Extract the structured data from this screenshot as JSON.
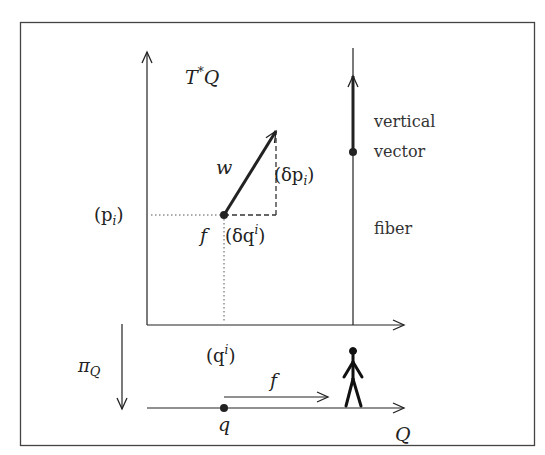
{
  "diagram": {
    "title_space": "T*Q",
    "labels": {
      "space_T": "T",
      "space_star": "*",
      "space_Q": "Q",
      "w": "w",
      "delta_p_open": "(δp",
      "delta_p_sub": "i",
      "delta_p_close": ")",
      "p_open": "(p",
      "p_sub": "i",
      "p_close": ")",
      "f_point": "f",
      "delta_q_open": "(δq",
      "delta_q_sup": "i",
      "delta_q_close": ")",
      "q_coord_open": "(q",
      "q_coord_sup": "i",
      "q_coord_close": ")",
      "pi": "π",
      "pi_sub": "Q",
      "f_arrow": "f",
      "q_point": "q",
      "base_Q": "Q",
      "vertical_line1": "vertical",
      "vertical_line2": "vector",
      "fiber": "fiber"
    },
    "colors": {
      "stroke": "#222222",
      "frame": "#444444",
      "background": "#ffffff"
    }
  }
}
